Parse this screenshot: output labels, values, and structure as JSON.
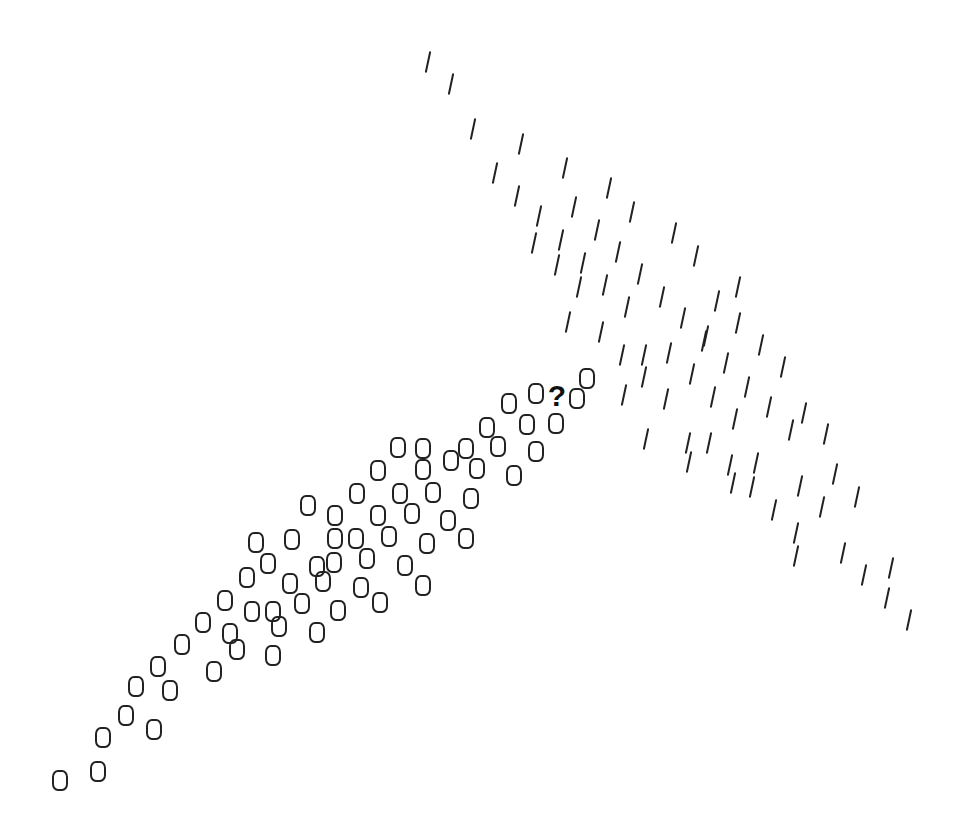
{
  "diagram": {
    "type": "scatter-glyph-classification",
    "glyph_color": "#222222",
    "query_marker": {
      "label": "?",
      "x": 557,
      "y": 397
    },
    "classes": [
      {
        "name": "zero",
        "glyph": "0",
        "points": [
          [
            60,
            780
          ],
          [
            98,
            771
          ],
          [
            103,
            737
          ],
          [
            126,
            715
          ],
          [
            154,
            729
          ],
          [
            136,
            686
          ],
          [
            170,
            690
          ],
          [
            158,
            666
          ],
          [
            182,
            644
          ],
          [
            214,
            671
          ],
          [
            203,
            622
          ],
          [
            230,
            633
          ],
          [
            237,
            649
          ],
          [
            225,
            600
          ],
          [
            252,
            611
          ],
          [
            273,
            611
          ],
          [
            279,
            626
          ],
          [
            273,
            655
          ],
          [
            247,
            577
          ],
          [
            268,
            563
          ],
          [
            290,
            583
          ],
          [
            302,
            603
          ],
          [
            317,
            632
          ],
          [
            323,
            581
          ],
          [
            317,
            566
          ],
          [
            334,
            562
          ],
          [
            338,
            610
          ],
          [
            361,
            587
          ],
          [
            380,
            602
          ],
          [
            256,
            542
          ],
          [
            292,
            539
          ],
          [
            308,
            505
          ],
          [
            335,
            515
          ],
          [
            335,
            538
          ],
          [
            357,
            493
          ],
          [
            356,
            538
          ],
          [
            367,
            558
          ],
          [
            378,
            515
          ],
          [
            389,
            536
          ],
          [
            400,
            493
          ],
          [
            412,
            513
          ],
          [
            405,
            565
          ],
          [
            423,
            585
          ],
          [
            427,
            543
          ],
          [
            433,
            492
          ],
          [
            448,
            520
          ],
          [
            466,
            538
          ],
          [
            471,
            498
          ],
          [
            378,
            470
          ],
          [
            398,
            447
          ],
          [
            423,
            448
          ],
          [
            423,
            469
          ],
          [
            451,
            460
          ],
          [
            466,
            448
          ],
          [
            477,
            468
          ],
          [
            498,
            446
          ],
          [
            514,
            475
          ],
          [
            536,
            451
          ],
          [
            487,
            427
          ],
          [
            509,
            403
          ],
          [
            527,
            424
          ],
          [
            536,
            393
          ],
          [
            556,
            423
          ],
          [
            577,
            398
          ],
          [
            587,
            378
          ]
        ]
      },
      {
        "name": "slash",
        "glyph": "/",
        "points": [
          [
            428,
            62
          ],
          [
            451,
            84
          ],
          [
            473,
            129
          ],
          [
            521,
            144
          ],
          [
            495,
            173
          ],
          [
            565,
            168
          ],
          [
            517,
            196
          ],
          [
            574,
            207
          ],
          [
            539,
            216
          ],
          [
            609,
            188
          ],
          [
            632,
            212
          ],
          [
            597,
            230
          ],
          [
            674,
            233
          ],
          [
            534,
            243
          ],
          [
            561,
            240
          ],
          [
            618,
            252
          ],
          [
            696,
            256
          ],
          [
            557,
            265
          ],
          [
            583,
            263
          ],
          [
            640,
            274
          ],
          [
            579,
            287
          ],
          [
            605,
            285
          ],
          [
            662,
            297
          ],
          [
            717,
            301
          ],
          [
            738,
            287
          ],
          [
            627,
            307
          ],
          [
            683,
            318
          ],
          [
            738,
            323
          ],
          [
            568,
            322
          ],
          [
            601,
            332
          ],
          [
            706,
            336
          ],
          [
            622,
            355
          ],
          [
            644,
            355
          ],
          [
            669,
            353
          ],
          [
            704,
            341
          ],
          [
            761,
            345
          ],
          [
            726,
            363
          ],
          [
            783,
            367
          ],
          [
            644,
            377
          ],
          [
            692,
            374
          ],
          [
            747,
            387
          ],
          [
            624,
            395
          ],
          [
            666,
            399
          ],
          [
            713,
            397
          ],
          [
            769,
            407
          ],
          [
            735,
            419
          ],
          [
            804,
            413
          ],
          [
            791,
            430
          ],
          [
            826,
            434
          ],
          [
            646,
            439
          ],
          [
            688,
            443
          ],
          [
            709,
            443
          ],
          [
            689,
            462
          ],
          [
            730,
            465
          ],
          [
            756,
            463
          ],
          [
            733,
            483
          ],
          [
            752,
            487
          ],
          [
            800,
            486
          ],
          [
            835,
            474
          ],
          [
            857,
            497
          ],
          [
            774,
            510
          ],
          [
            822,
            507
          ],
          [
            796,
            533
          ],
          [
            796,
            556
          ],
          [
            843,
            553
          ],
          [
            864,
            575
          ],
          [
            891,
            568
          ],
          [
            887,
            598
          ],
          [
            909,
            620
          ]
        ]
      }
    ]
  }
}
